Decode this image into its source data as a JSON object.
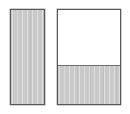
{
  "figure": {
    "background_color": "#ffffff",
    "width": 130,
    "height": 114,
    "shapes": [
      {
        "name": "left-rectangle",
        "x": 10,
        "y": 9,
        "width": 35,
        "height": 96,
        "border_color": "#575757",
        "fill_color": "#c9c9c9",
        "fill_pattern": "vertical-hatch",
        "fill_percent": 100,
        "label": ""
      },
      {
        "name": "right-rectangle",
        "x": 57,
        "y": 9,
        "width": 64,
        "height": 96,
        "border_color": "#575757",
        "fill_color": "#c9c9c9",
        "fill_pattern": "vertical-hatch",
        "fill_percent": 40,
        "divider_color": "#6f6f6f",
        "unfilled_color": "#ffffff",
        "label": ""
      }
    ]
  },
  "chart_data": {
    "type": "bar",
    "title": "",
    "xlabel": "",
    "ylabel": "",
    "categories": [
      "left-rectangle",
      "right-rectangle"
    ],
    "values": [
      100,
      40
    ],
    "ylim": [
      0,
      100
    ],
    "grid": false,
    "legend": null,
    "annotations": []
  }
}
